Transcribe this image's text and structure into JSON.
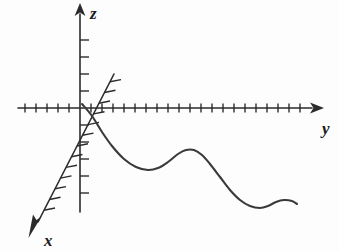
{
  "figure": {
    "background_color": "#fdfdfd",
    "ink_color": "#2b2b2b",
    "curve_color": "#3a3a3a"
  },
  "labels": {
    "x_axis": "x",
    "y_axis": "y",
    "z_axis": "z"
  },
  "axes": {
    "origin": {
      "x": 80,
      "y": 108
    },
    "y_axis": {
      "name": "y",
      "direction": "right",
      "start": {
        "x": 18,
        "y": 108
      },
      "end": {
        "x": 318,
        "y": 108
      },
      "arrow_at": "end",
      "tick_spacing": 11,
      "tick_length": 9,
      "tick_count_left_of_origin": 5,
      "tick_count_right_of_origin": 21,
      "label_position": {
        "x": 324,
        "y": 131
      }
    },
    "z_axis": {
      "name": "z",
      "direction": "up",
      "start": {
        "x": 80,
        "y": 212
      },
      "end": {
        "x": 80,
        "y": 8
      },
      "arrow_at": "end",
      "tick_spacing": 17,
      "tick_length": 9,
      "tick_side": "right",
      "tick_count_above_origin": 5,
      "tick_count_below_origin": 6,
      "label_position": {
        "x": 92,
        "y": 17
      }
    },
    "x_axis": {
      "name": "x",
      "direction": "down-left (toward viewer)",
      "start": {
        "x": 113,
        "y": 76
      },
      "end": {
        "x": 33,
        "y": 232
      },
      "arrow_at": "end",
      "tick_spacing": 12,
      "tick_length": 11,
      "label_position": {
        "x": 46,
        "y": 243
      }
    }
  },
  "chart_data": {
    "type": "line",
    "title": "",
    "xlabel": "y",
    "ylabel": "z",
    "grid": false,
    "legend": null,
    "axis_ranges": {
      "y": [
        -5.6,
        21.6
      ],
      "z": [
        -6.1,
        5.9
      ]
    },
    "series": [
      {
        "name": "z = f(y)",
        "color": "#3a3a3a",
        "points_px": [
          [
            82,
            104
          ],
          [
            92,
            116
          ],
          [
            102,
            132
          ],
          [
            112,
            146
          ],
          [
            124,
            159
          ],
          [
            136,
            167
          ],
          [
            148,
            170
          ],
          [
            158,
            168
          ],
          [
            168,
            162
          ],
          [
            178,
            154
          ],
          [
            186,
            150
          ],
          [
            194,
            150
          ],
          [
            202,
            155
          ],
          [
            210,
            164
          ],
          [
            220,
            177
          ],
          [
            230,
            190
          ],
          [
            240,
            200
          ],
          [
            250,
            206
          ],
          [
            260,
            208
          ],
          [
            268,
            206
          ],
          [
            276,
            202
          ],
          [
            284,
            200
          ],
          [
            292,
            201
          ],
          [
            297,
            204
          ]
        ],
        "key_features": [
          {
            "kind": "start",
            "px": [
              82,
              104
            ],
            "note": "leaves origin heading down-right"
          },
          {
            "kind": "local-minimum",
            "px": [
              150,
              170
            ]
          },
          {
            "kind": "local-maximum",
            "px": [
              190,
              149
            ]
          },
          {
            "kind": "local-minimum",
            "px": [
              261,
              208
            ]
          },
          {
            "kind": "local-maximum",
            "px": [
              288,
              200
            ]
          },
          {
            "kind": "end",
            "px": [
              297,
              204
            ]
          }
        ]
      }
    ]
  }
}
